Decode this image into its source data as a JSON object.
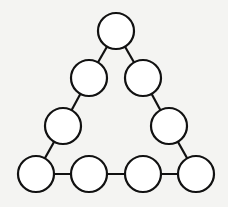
{
  "diagram": {
    "type": "triangle-node-puzzle",
    "stroke_color": "#111111",
    "fill_color": "#ffffff",
    "background_color": "#f4f4f2",
    "node_radius": 18,
    "nodes": [
      {
        "id": "top",
        "x": 116,
        "y": 31
      },
      {
        "id": "left-1",
        "x": 89,
        "y": 78
      },
      {
        "id": "right-1",
        "x": 143,
        "y": 78
      },
      {
        "id": "left-2",
        "x": 63,
        "y": 126
      },
      {
        "id": "right-2",
        "x": 169,
        "y": 126
      },
      {
        "id": "bottom-1",
        "x": 36,
        "y": 174
      },
      {
        "id": "bottom-2",
        "x": 89,
        "y": 174
      },
      {
        "id": "bottom-3",
        "x": 143,
        "y": 174
      },
      {
        "id": "bottom-4",
        "x": 196,
        "y": 174
      }
    ],
    "edges": [
      [
        "top",
        "left-1"
      ],
      [
        "left-1",
        "left-2"
      ],
      [
        "left-2",
        "bottom-1"
      ],
      [
        "top",
        "right-1"
      ],
      [
        "right-1",
        "right-2"
      ],
      [
        "right-2",
        "bottom-4"
      ],
      [
        "bottom-1",
        "bottom-2"
      ],
      [
        "bottom-2",
        "bottom-3"
      ],
      [
        "bottom-3",
        "bottom-4"
      ]
    ]
  }
}
